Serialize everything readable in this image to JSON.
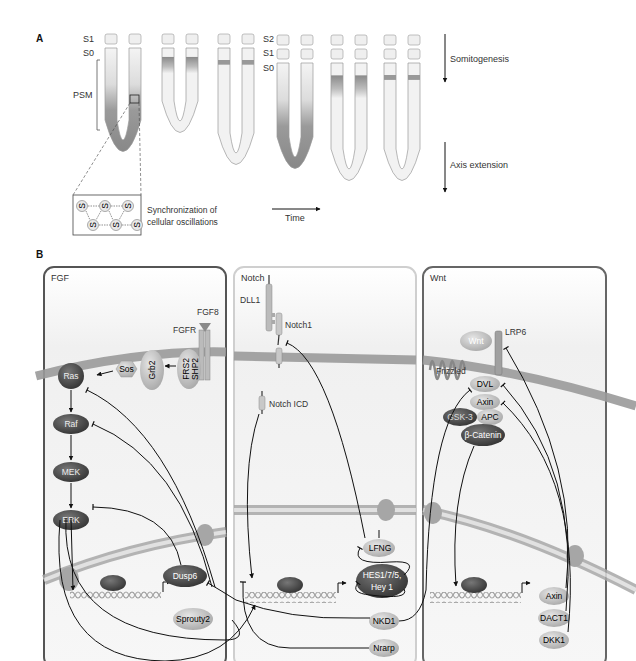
{
  "panel_a": {
    "letter": "A",
    "labels_left": {
      "s1": "S1",
      "s0": "S0",
      "psm": "PSM"
    },
    "labels_mid": {
      "s2": "S2",
      "s1": "S1",
      "s0": "S0"
    },
    "somitogenesis": "Somitogenesis",
    "axis_extension": "Axis extension",
    "time": "Time",
    "inset_caption_line1": "Synchronization of",
    "inset_caption_line2": "cellular oscillations",
    "inset_cell_label": "S",
    "psm_shapes": [
      {
        "x": 105,
        "top": 48,
        "bottom": 165,
        "somites": 1,
        "fill": "full-gradient"
      },
      {
        "x": 162,
        "top": 48,
        "bottom": 146,
        "somites": 1,
        "fill": "band-wide"
      },
      {
        "x": 218,
        "top": 48,
        "bottom": 178,
        "somites": 1,
        "fill": "band-narrow"
      },
      {
        "x": 277,
        "top": 63,
        "bottom": 182,
        "somites": 2,
        "fill": "full-gradient"
      },
      {
        "x": 331,
        "top": 63,
        "bottom": 194,
        "somites": 2,
        "fill": "band-wide"
      },
      {
        "x": 384,
        "top": 63,
        "bottom": 194,
        "somites": 2,
        "fill": "band-narrow"
      }
    ]
  },
  "panel_b": {
    "letter": "B",
    "panels": [
      {
        "id": "fgf",
        "title": "FGF",
        "border": "#555555"
      },
      {
        "id": "notch",
        "title": "Notch",
        "border": "#c8c8c8"
      },
      {
        "id": "wnt",
        "title": "Wnt",
        "border": "#666666"
      }
    ],
    "fgf": {
      "ligand": "FGF8",
      "receptor": "FGFR",
      "adaptor": "FRS2\nSHP2",
      "adaptor_line1": "FRS2",
      "adaptor_line2": "SHP2",
      "grb2": "Grb2",
      "sos": "Sos",
      "cascade": [
        "Ras",
        "Raf",
        "MEK",
        "ERK"
      ],
      "targets": [
        "Dusp6",
        "Sprouty2"
      ]
    },
    "notch": {
      "ligand": "DLL1",
      "label_top": "Notch",
      "receptor": "Notch1",
      "icd": "Notch ICD",
      "targets": [
        "LFNG",
        "HES1/7/5,",
        "Hey 1",
        "NKD1",
        "Nrarp"
      ]
    },
    "wnt": {
      "ligand": "Wnt",
      "coreceptor": "LRP6",
      "receptor": "Frizzled",
      "complex": [
        "DVL",
        "Axin",
        "GSK-3",
        "APC",
        "β-Catenin"
      ],
      "targets": [
        "Axin",
        "DACT1",
        "DKK1"
      ]
    }
  },
  "colors": {
    "dark_node": "#4a4a4a",
    "light_node": "#bdbdbd",
    "membrane": "#9a9a9a",
    "psm_dark": "#8a8a8a",
    "psm_light": "#f2f2f2"
  }
}
